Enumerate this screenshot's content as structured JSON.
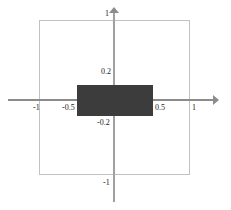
{
  "figure": {
    "title": "",
    "background_color": "#ffffff",
    "axis_color": "#8c8c8c",
    "region_border_color": "#c2c2c2",
    "fill_color": "#3c3c3c"
  },
  "axes": {
    "x_label": "",
    "y_label": "",
    "x_arrow": "arrow-right",
    "y_arrow": "arrow-up"
  },
  "labels": {
    "x_neg1": "-1",
    "x_neg05": "-0.5",
    "x_pos05": "0.5",
    "x_pos1": "1",
    "y_pos1": "1",
    "y_pos02": "0.2",
    "y_neg02": "-0.2",
    "y_neg1": "-1"
  },
  "chart_data": {
    "type": "diagram",
    "title": "",
    "xlabel": "",
    "ylabel": "",
    "xlim": [
      -1.15,
      1.15
    ],
    "ylim": [
      -1.15,
      1.15
    ],
    "grid": false,
    "legend": "none",
    "xticks": [
      -1,
      -0.5,
      0.5,
      1
    ],
    "xticklabels": [
      "-1",
      "-0.5",
      "0.5",
      "1"
    ],
    "yticks": [
      -1,
      -0.2,
      0.2,
      1
    ],
    "yticklabels": [
      "-1",
      "-0.2",
      "0.2",
      "1"
    ],
    "shapes": [
      {
        "name": "outer-square",
        "type": "rectangle",
        "x_range": [
          -1,
          1
        ],
        "y_range": [
          -1,
          1
        ],
        "fill": "none",
        "stroke": "#c2c2c2",
        "stroke_width": 1
      },
      {
        "name": "inner-filled-rectangle",
        "type": "rectangle",
        "x_range": [
          -0.5,
          0.5
        ],
        "y_range": [
          -0.2,
          0.2
        ],
        "fill": "#3c3c3c",
        "stroke": "none"
      }
    ]
  }
}
